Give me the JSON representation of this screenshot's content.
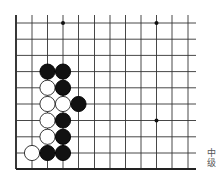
{
  "diagram": {
    "type": "go-board-fragment",
    "grid": {
      "columns_x": [
        16,
        32,
        47.5,
        63,
        78.5,
        94.5,
        110,
        125.5,
        141,
        156.5,
        172,
        188
      ],
      "rows_y": [
        23,
        39.2,
        55.4,
        71.6,
        87.8,
        104,
        120.5,
        136.8,
        153,
        169
      ],
      "right_extent": 196,
      "top_extent": 15,
      "line_color": "#333333",
      "edge_color": "#222222"
    },
    "star_points": [
      {
        "col": 3,
        "row": 0
      },
      {
        "col": 9,
        "row": 0
      },
      {
        "col": 9,
        "row": 6
      }
    ],
    "stones": [
      {
        "col": 2,
        "row": 3,
        "color": "black"
      },
      {
        "col": 3,
        "row": 3,
        "color": "black"
      },
      {
        "col": 2,
        "row": 4,
        "color": "white"
      },
      {
        "col": 3,
        "row": 4,
        "color": "black"
      },
      {
        "col": 2,
        "row": 5,
        "color": "white"
      },
      {
        "col": 3,
        "row": 5,
        "color": "white"
      },
      {
        "col": 4,
        "row": 5,
        "color": "black"
      },
      {
        "col": 2,
        "row": 6,
        "color": "white"
      },
      {
        "col": 3,
        "row": 6,
        "color": "black"
      },
      {
        "col": 2,
        "row": 7,
        "color": "white"
      },
      {
        "col": 3,
        "row": 7,
        "color": "black"
      },
      {
        "col": 1,
        "row": 8,
        "color": "white"
      },
      {
        "col": 2,
        "row": 8,
        "color": "black"
      },
      {
        "col": 3,
        "row": 8,
        "color": "black"
      }
    ],
    "stone_radius": 7.6
  },
  "caption": {
    "line1": "中",
    "line2": "级"
  }
}
